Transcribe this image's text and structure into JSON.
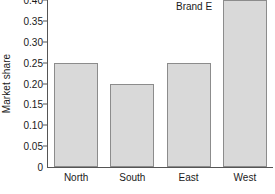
{
  "chart_data": {
    "type": "bar",
    "title": "",
    "subtitle": "",
    "xlabel": "",
    "ylabel": "Market share",
    "categories": [
      "North",
      "South",
      "East",
      "West"
    ],
    "values": [
      0.25,
      0.2,
      0.25,
      0.4
    ],
    "series": [
      {
        "name": "Market share",
        "values": [
          0.25,
          0.2,
          0.25,
          0.4
        ]
      }
    ],
    "ylim": [
      0,
      0.4
    ],
    "xlim": [
      0,
      4
    ],
    "ytick_labels": [
      "0",
      "0.05",
      "0.10",
      "0.15",
      "0.20",
      "0.25",
      "0.30",
      "0.35",
      "0.40"
    ],
    "ytick_values": [
      0,
      0.05,
      0.1,
      0.15,
      0.2,
      0.25,
      0.3,
      0.35,
      0.4
    ],
    "grid": false,
    "legend": false,
    "legend_position": "none",
    "annotations": [
      {
        "text": "Brand E",
        "target_category": "West",
        "position": "top-right"
      }
    ],
    "colors": {
      "bar_fill": "#d9d9d9",
      "bar_edge": "#8c8c8c",
      "axis": "#555555",
      "text": "#1a1a1a",
      "background": "#ffffff"
    }
  }
}
